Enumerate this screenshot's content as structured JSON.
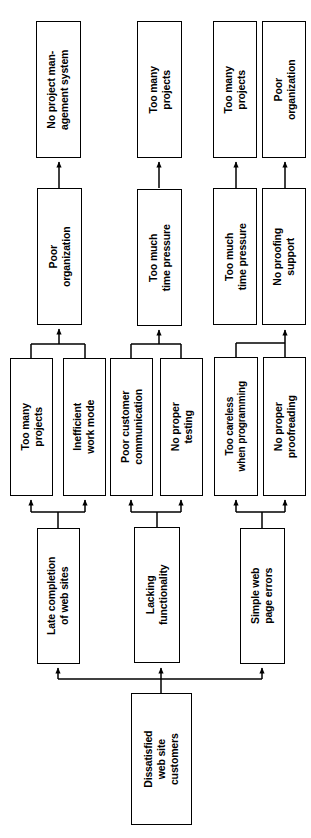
{
  "diagram": {
    "type": "cause-tree",
    "orientation": "rotated-90-ccw",
    "root_label": "Dissatisfied\nweb site\ncustomers",
    "stroke_color": "#000000",
    "fill_color": "#ffffff",
    "nodes": {
      "root": "Dissatisfied\nweb site\ncustomers",
      "b1_late": "Late completion\nof web sites",
      "b1_lacking": "Lacking\nfunctionality",
      "b1_simple": "Simple web\npage errors",
      "b2_toomany": "Too many\nprojects",
      "b2_ineff": "Inefficient\nwork mode",
      "b2_poorcust": "Poor customer\ncommunication",
      "b2_notest": "No proper\ntesting",
      "b2_careless": "Too careless\nwhen programming",
      "b2_noproof": "No proper\nproofreading",
      "b3_poororg": "Poor\norganization",
      "b3_timepress2": "Too much\ntime pressure",
      "b3_timepress3": "Too much\ntime pressure",
      "b3_noproofsup": "No proofing\nsupport",
      "b4_nopms": "No project man-\nagement system",
      "b4_toomany2": "Too many\nprojects",
      "b4_toomany3": "Too many\nprojects",
      "b4_poororg3": "Poor\norganization"
    }
  }
}
